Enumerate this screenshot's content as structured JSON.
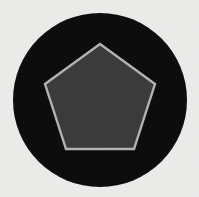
{
  "canvas": {
    "width": 199,
    "height": 197,
    "background_color": "#f3f2f0",
    "description": "scanned-paper style white background with faint grain"
  },
  "shapes": {
    "circle": {
      "name": "black-circle",
      "center_x": 100,
      "center_y": 100,
      "radius": 87,
      "fill_color": "#0b0b0b",
      "stroke_color": "none",
      "stroke_width": 0
    },
    "pentagon": {
      "name": "gray-pentagon",
      "center_x": 100,
      "center_y": 102,
      "circumradius": 58,
      "sides": 5,
      "rotation_deg": -90,
      "fill_color": "#3c3c3c",
      "stroke_color": "#b9b9b9",
      "stroke_width": 2.4,
      "vertices": [
        {
          "x": 100,
          "y": 44
        },
        {
          "x": 155,
          "y": 84
        },
        {
          "x": 134,
          "y": 149
        },
        {
          "x": 66,
          "y": 149
        },
        {
          "x": 45,
          "y": 84
        }
      ]
    }
  },
  "noise": {
    "grain_opacity": 0.07,
    "grain_color": "#8a8a84"
  }
}
